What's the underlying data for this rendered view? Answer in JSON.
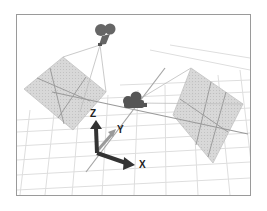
{
  "figure": {
    "axes": {
      "x_label": "X",
      "y_label": "Y",
      "z_label": "Z"
    },
    "objects": [
      {
        "name": "camera-top",
        "type": "camera"
      },
      {
        "name": "camera-center",
        "type": "camera"
      },
      {
        "name": "image-plane-left",
        "type": "plane"
      },
      {
        "name": "image-plane-right",
        "type": "plane"
      }
    ],
    "colors": {
      "frame_border": "#9a9a9a",
      "grid": "#dcdcdc",
      "plane_fill": "#cfcfcf",
      "plane_lines": "#8c8c8c",
      "camera": "#5a5a5a",
      "axis_dark": "#333333",
      "axis_light": "#9a9a9a"
    }
  }
}
